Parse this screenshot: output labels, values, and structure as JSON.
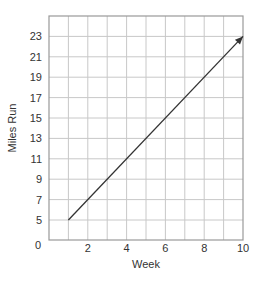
{
  "chart_data": {
    "type": "line",
    "title": "",
    "xlabel": "Week",
    "ylabel": "Miles Run",
    "x_ticks": [
      "0",
      "2",
      "4",
      "6",
      "8",
      "10"
    ],
    "y_ticks": [
      "5",
      "7",
      "9",
      "11",
      "13",
      "15",
      "17",
      "19",
      "21",
      "23"
    ],
    "xlim": [
      0,
      10
    ],
    "ylim_display": "broken axis: 0 at bottom, then 5 to 25",
    "grid": true,
    "legend": null,
    "series": [
      {
        "name": "Miles Run",
        "x": [
          1,
          2,
          3,
          4,
          5,
          6,
          7,
          8,
          9,
          10
        ],
        "values": [
          5,
          7,
          9,
          11,
          13,
          15,
          17,
          19,
          21,
          23
        ],
        "arrow_at_end": true
      }
    ]
  },
  "labels": {
    "xlabel": "Week",
    "ylabel": "Miles Run",
    "origin": "0"
  },
  "colors": {
    "grid": "#c8c8c8",
    "frame": "#999999",
    "line": "#333333",
    "text": "#333333"
  }
}
